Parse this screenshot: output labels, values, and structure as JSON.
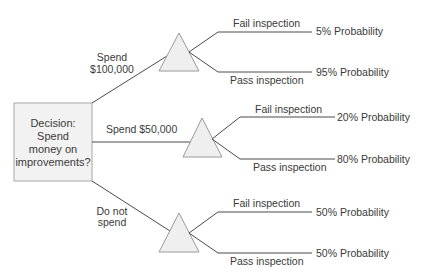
{
  "decision": {
    "lines": [
      "Decision:",
      "Spend",
      "money on",
      "improvements?"
    ]
  },
  "options": [
    {
      "label_lines": [
        "Spend",
        "$100,000"
      ],
      "outcomes": [
        {
          "label": "Fail inspection",
          "probability": "5% Probability"
        },
        {
          "label": "Pass inspection",
          "probability": "95% Probability"
        }
      ]
    },
    {
      "label_lines": [
        "Spend $50,000"
      ],
      "outcomes": [
        {
          "label": "Fail inspection",
          "probability": "20% Probability"
        },
        {
          "label": "Pass inspection",
          "probability": "80% Probability"
        }
      ]
    },
    {
      "label_lines": [
        "Do not",
        "spend"
      ],
      "outcomes": [
        {
          "label": "Fail inspection",
          "probability": "50% Probability"
        },
        {
          "label": "Pass inspection",
          "probability": "50% Probability"
        }
      ]
    }
  ],
  "colors": {
    "text": "#3a3a3a",
    "node_fill": "#efefef",
    "node_border": "#9a9a9a",
    "edge": "#4a4a4a"
  }
}
